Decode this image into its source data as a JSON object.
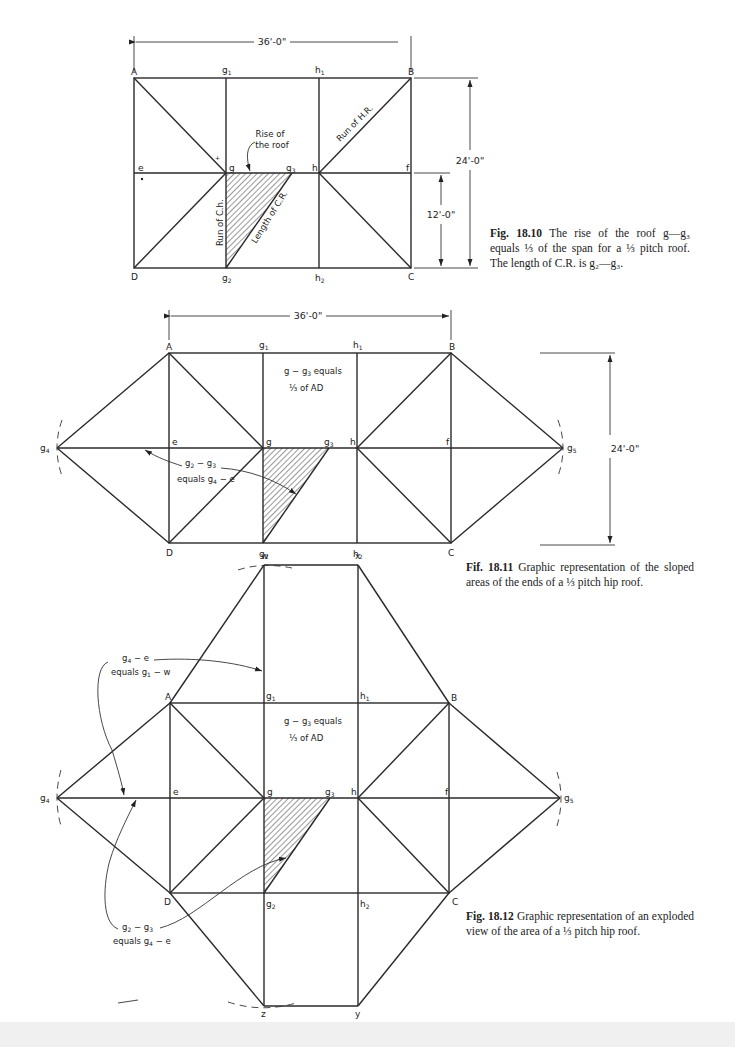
{
  "figures": [
    {
      "id": "fig-18-10",
      "caption_number": "Fig. 18.10",
      "caption_text": "The rise of the roof g—g₃ equals ⅓ of the span for a ⅓ pitch roof. The length of C.R. is g₂—g₃.",
      "dimensions": {
        "width": "36'-0\"",
        "height": "24'-0\"",
        "half_height": "12'-0\""
      },
      "points": {
        "A": "A",
        "B": "B",
        "C": "C",
        "D": "D",
        "e": "e",
        "f": "f",
        "g": "g",
        "h": "h",
        "g1": "g",
        "g1_sub": "1",
        "h1": "h",
        "h1_sub": "1",
        "g2": "g",
        "g2_sub": "2",
        "h2": "h",
        "h2_sub": "2",
        "g3": "g",
        "g3_sub": "3"
      },
      "annotations": {
        "rise_line1": "Rise of",
        "rise_line2": "the roof",
        "run_hr": "Run of H.R.",
        "run_ch": "Run of C.h.",
        "length_cr": "Length of C.R."
      }
    },
    {
      "id": "fig-18-11",
      "caption_number": "Fif. 18.11",
      "caption_text": "Graphic representation of the sloped areas of the ends of a ⅓ pitch hip roof.",
      "dimensions": {
        "width": "36'-0\"",
        "height": "24'-0\""
      },
      "points": {
        "A": "A",
        "B": "B",
        "C": "C",
        "D": "D",
        "e": "e",
        "f": "f",
        "g": "g",
        "h": "h",
        "g4": "g",
        "g4_sub": "4",
        "g5": "g",
        "g5_sub": "5"
      },
      "annotations": {
        "eq1_line1_a": "g − g",
        "eq1_line1_sub": "3",
        "eq1_line1_b": " equals",
        "eq1_line2": "⅓ of AD",
        "eq2_line1_a": "g",
        "eq2_line1_sub1": "2",
        "eq2_line1_b": " − g",
        "eq2_line1_sub2": "3",
        "eq2_line2_a": "equals g",
        "eq2_line2_sub": "4",
        "eq2_line2_b": " − e"
      }
    },
    {
      "id": "fig-18-12",
      "caption_number": "Fig. 18.12",
      "caption_text": "Graphic representation of an exploded view of the area of a ⅓ pitch hip roof.",
      "points": {
        "w": "w",
        "x": "x",
        "y": "y",
        "z": "z"
      },
      "annotations": {
        "eq3_line1_a": "g",
        "eq3_line1_sub": "4",
        "eq3_line1_b": " − e",
        "eq3_line2_a": "equals g",
        "eq3_line2_sub": "1",
        "eq3_line2_b": " − w",
        "eq4_line1_a": "g",
        "eq4_line1_sub1": "2",
        "eq4_line1_b": " − g",
        "eq4_line1_sub2": "3",
        "eq4_line2_a": "equals g",
        "eq4_line2_sub": "4",
        "eq4_line2_b": " − e"
      }
    }
  ]
}
